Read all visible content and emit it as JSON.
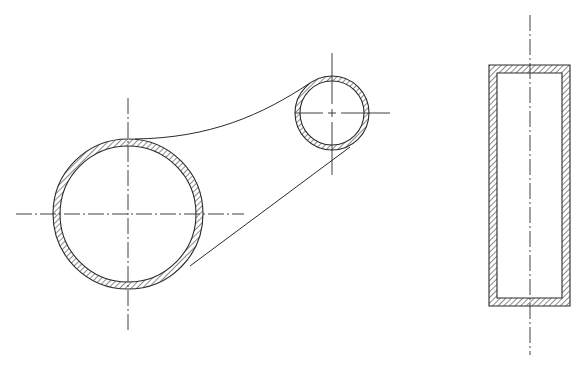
{
  "drawing": {
    "title": "",
    "colors": {
      "line": "#2a2a2a",
      "background": "#ffffff",
      "hatch": "#2a2a2a"
    },
    "front_view": {
      "large_boss": {
        "cx": 128,
        "cy": 214,
        "r_outer": 75,
        "r_inner": 68,
        "hatched": true
      },
      "small_boss": {
        "cx": 332,
        "cy": 113,
        "r_outer": 37,
        "r_inner": 32,
        "hatched": true
      },
      "upper_web_curve": "M 135 139 C 210 138, 262 115, 310 83",
      "lower_web_line": {
        "x1": 190,
        "y1": 266,
        "x2": 350,
        "y2": 147
      },
      "large_center_lines": {
        "horizontal": {
          "x1": 16,
          "y1": 214,
          "x2": 244,
          "y2": 214
        },
        "vertical": {
          "x1": 128,
          "y1": 98,
          "x2": 128,
          "y2": 332
        }
      },
      "small_center_lines": {
        "horizontal": {
          "x1": 295,
          "y1": 113,
          "x2": 390,
          "y2": 113
        },
        "vertical": {
          "x1": 332,
          "y1": 53,
          "x2": 332,
          "y2": 175
        }
      }
    },
    "side_view": {
      "outer_rect": {
        "x": 489,
        "y": 65,
        "w": 81,
        "h": 241
      },
      "inner_rect": {
        "x": 497,
        "y": 73,
        "w": 65,
        "h": 225
      },
      "center_line": {
        "x1": 530,
        "y1": 15,
        "x2": 530,
        "y2": 355
      }
    }
  }
}
